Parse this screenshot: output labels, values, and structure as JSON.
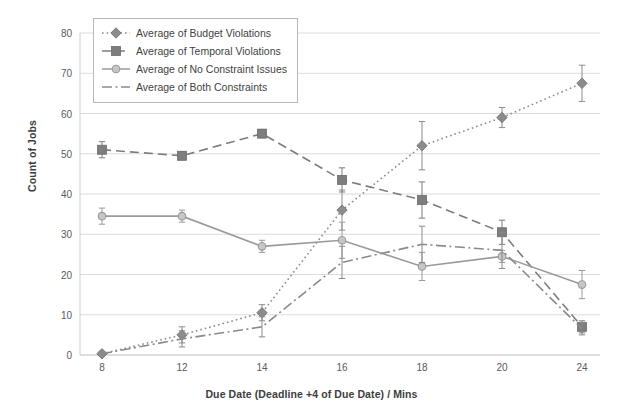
{
  "chart_data": {
    "type": "line",
    "title": "",
    "xlabel": "Due Date (Deadline +4 of Due Date)  /  Mins",
    "ylabel": "Count of Jobs",
    "categories": [
      "8",
      "12",
      "14",
      "16",
      "18",
      "20",
      "24"
    ],
    "x_ticklabels": [
      "8",
      "12",
      "14",
      "16",
      "18",
      "20",
      "24"
    ],
    "y_ticklabels": [
      "0",
      "10",
      "20",
      "30",
      "40",
      "50",
      "60",
      "70",
      "80"
    ],
    "ylim": [
      0,
      80
    ],
    "ytick_step": 10,
    "grid": true,
    "grid_axis": "y",
    "legend_position": "upper-left-inside",
    "error_bars": true,
    "series": [
      {
        "name": "Average of Budget Violations",
        "marker": "diamond",
        "linestyle": "dotted",
        "color": "#8c8c8c",
        "values": [
          0.3,
          5.0,
          10.5,
          36.0,
          52.0,
          59.0,
          67.5
        ],
        "errors": [
          0.5,
          2.0,
          2.0,
          5.0,
          6.0,
          2.5,
          4.5
        ]
      },
      {
        "name": "Average of Temporal Violations",
        "marker": "square",
        "linestyle": "dashed",
        "color": "#7d7d7d",
        "values": [
          51.0,
          49.5,
          55.0,
          43.5,
          38.5,
          30.5,
          7.0
        ],
        "errors": [
          2.0,
          1.0,
          1.0,
          3.0,
          4.5,
          3.0,
          1.5
        ]
      },
      {
        "name": "Average of No Constraint Issues",
        "marker": "circle",
        "linestyle": "solid",
        "color": "#9a9a9a",
        "values": [
          34.5,
          34.5,
          27.0,
          28.5,
          22.0,
          24.5,
          17.5
        ],
        "errors": [
          2.0,
          1.5,
          1.5,
          4.5,
          3.5,
          1.5,
          3.5
        ]
      },
      {
        "name": "Average of Both Constraints",
        "marker": "none",
        "linestyle": "dashdot",
        "color": "#8a8a8a",
        "values": [
          0.3,
          4.0,
          7.0,
          23.0,
          27.5,
          26.0,
          6.5
        ],
        "errors": [
          0.4,
          2.0,
          2.5,
          4.0,
          4.5,
          4.5,
          1.5
        ]
      }
    ]
  },
  "legend": {
    "items": [
      "Average of Budget Violations",
      "Average of Temporal Violations",
      "Average of No Constraint Issues",
      "Average of Both Constraints"
    ]
  },
  "colors": {
    "grid": "#dcdcdc",
    "axis_text": "#5a5a5a",
    "title_text": "#3d3d3d",
    "legend_border": "#b9b9b9",
    "background": "#ffffff"
  }
}
